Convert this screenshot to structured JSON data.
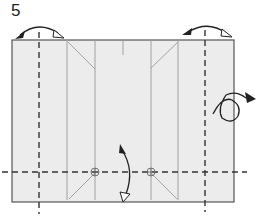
{
  "diagram": {
    "type": "origami-step",
    "step_number": "5",
    "colors": {
      "paper_fill": "#ececec",
      "paper_edge": "#555555",
      "crease_line": "#999999",
      "fold_line": "#333333",
      "arrow": "#222222"
    },
    "paper": {
      "x": 12,
      "y": 40,
      "width": 222,
      "height": 162
    },
    "valley_folds": [
      {
        "orientation": "vertical",
        "x": 39,
        "y1": 32,
        "y2": 214
      },
      {
        "orientation": "vertical",
        "x": 205,
        "y1": 30,
        "y2": 212
      },
      {
        "orientation": "horizontal",
        "y": 172,
        "x1": 2,
        "x2": 247
      }
    ],
    "creases": [
      {
        "x1": 67,
        "y1": 40,
        "x2": 67,
        "y2": 200
      },
      {
        "x1": 95,
        "y1": 40,
        "x2": 95,
        "y2": 200
      },
      {
        "x1": 151,
        "y1": 40,
        "x2": 151,
        "y2": 200
      },
      {
        "x1": 178,
        "y1": 40,
        "x2": 178,
        "y2": 200
      },
      {
        "x1": 123,
        "y1": 40,
        "x2": 123,
        "y2": 55
      },
      {
        "x1": 68,
        "y1": 42,
        "x2": 95,
        "y2": 69
      },
      {
        "x1": 178,
        "y1": 42,
        "x2": 151,
        "y2": 68
      },
      {
        "x1": 69,
        "y1": 199,
        "x2": 95,
        "y2": 173
      },
      {
        "x1": 151,
        "y1": 173,
        "x2": 177,
        "y2": 199
      }
    ],
    "reference_points": [
      {
        "cx": 95,
        "cy": 172,
        "r": 4
      },
      {
        "cx": 151,
        "cy": 172,
        "r": 4
      }
    ],
    "arrows": [
      {
        "name": "fold-left-edge-arrow",
        "description": "fold and unfold left flap"
      },
      {
        "name": "fold-right-edge-arrow",
        "description": "fold and unfold right flap"
      },
      {
        "name": "fold-bottom-edge-arrow",
        "description": "fold and unfold bottom flap"
      },
      {
        "name": "turn-over-arrow",
        "description": "turn model over"
      }
    ]
  }
}
